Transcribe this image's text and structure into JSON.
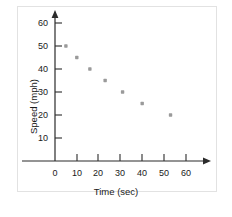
{
  "chart_data": {
    "type": "scatter",
    "title": "",
    "xlabel": "Time (sec)",
    "ylabel": "Speed (mph)",
    "xlim": [
      0,
      65
    ],
    "ylim": [
      0,
      65
    ],
    "xticks": [
      0,
      10,
      20,
      30,
      40,
      50,
      60
    ],
    "yticks": [
      10,
      20,
      30,
      40,
      50,
      60
    ],
    "xtick_labels": [
      "0",
      "10",
      "20",
      "30",
      "40",
      "50",
      "60"
    ],
    "ytick_labels": [
      "10",
      "20",
      "30",
      "40",
      "50",
      "60"
    ],
    "grid": false,
    "legend": null,
    "origin_label": "0",
    "marker_color": "#9a9a9a",
    "axis_color": "#2b2b2b",
    "series": [
      {
        "name": "Speed vs Time",
        "x": [
          5,
          10,
          16,
          23,
          31,
          40,
          53
        ],
        "y": [
          50,
          45,
          40,
          35,
          30,
          25,
          20
        ]
      }
    ]
  },
  "figure": {
    "border_color": "#e2e2e2",
    "background": "#ffffff"
  }
}
